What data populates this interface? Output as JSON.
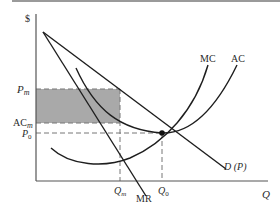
{
  "diagram": {
    "type": "monopoly-price-vs-competitive-equilibrium",
    "axes": {
      "y_label": "$",
      "x_label": "Q"
    },
    "curves": {
      "mc_label": "MC",
      "ac_label": "AC",
      "mr_label": "MR",
      "demand_label": "D (P)"
    },
    "price_levels": {
      "pm_label": "P",
      "pm_sub": "m",
      "acm_label": "AC",
      "acm_sub": "m",
      "p0_label": "P",
      "p0_sub": "0"
    },
    "quantities": {
      "qm_label": "Q",
      "qm_sub": "m",
      "q0_label": "Q",
      "q0_sub": "0"
    },
    "colors": {
      "line": "#1e1e1e",
      "shade": "#a9a9a9",
      "dash": "#777777"
    }
  }
}
